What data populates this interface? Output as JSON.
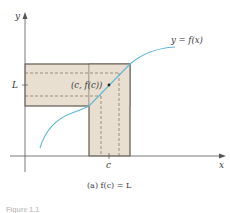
{
  "diagram": {
    "axis_labels": {
      "x": "x",
      "y": "y"
    },
    "tick_labels": {
      "L": "L",
      "c": "c"
    },
    "curve_label": "y = f(x)",
    "point_label": "(c, f(c))",
    "caption": "(a) f(c) = L",
    "figure_label": "Figure 1.1",
    "colors": {
      "curve": "#5fb8d8",
      "band_fill": "#e8dfd0",
      "band_border": "#6a6258",
      "dashed": "#7a6a5a",
      "axes": "#555555",
      "text": "#3a3a3a"
    }
  }
}
